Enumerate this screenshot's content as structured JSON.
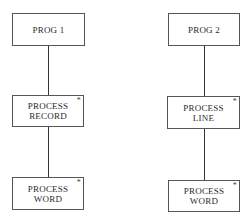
{
  "diagram": {
    "trees": [
      {
        "root": {
          "label": "PROG 1",
          "iterated": false
        },
        "child": {
          "label": "PROCESS\nRECORD",
          "iterated": true,
          "marker": "*"
        },
        "grandchild": {
          "label": "PROCESS\nWORD",
          "iterated": true,
          "marker": "*"
        }
      },
      {
        "root": {
          "label": "PROG 2",
          "iterated": false
        },
        "child": {
          "label": "PROCESS\nLINE",
          "iterated": true,
          "marker": "*"
        },
        "grandchild": {
          "label": "PROCESS\nWORD",
          "iterated": true,
          "marker": "*"
        }
      }
    ]
  }
}
